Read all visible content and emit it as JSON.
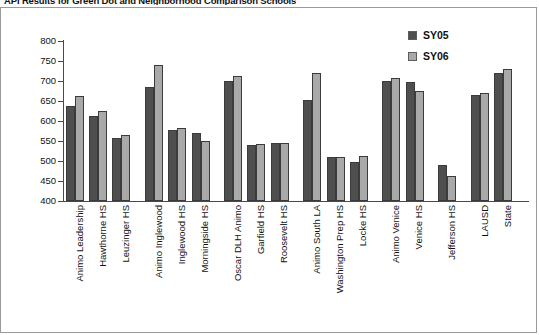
{
  "chart_title": "API Results for Green Dot and Neighborhood Comparison Schools",
  "legend": {
    "position": "top-right",
    "entries": [
      {
        "label": "SY05",
        "color": "#4f4f4f"
      },
      {
        "label": "SY06",
        "color": "#a9a9a9"
      }
    ]
  },
  "axis": {
    "y_ticks": [
      800,
      750,
      700,
      650,
      600,
      550,
      500,
      450,
      400
    ],
    "y_min": 400,
    "y_max": 800
  },
  "chart_data": {
    "type": "bar",
    "title": "API Results for Green Dot and Neighborhood Comparison Schools",
    "xlabel": "",
    "ylabel": "",
    "ylim": [
      400,
      800
    ],
    "grid": false,
    "legend_position": "top-right",
    "categories": [
      "Animo Leadership",
      "Hawthorne HS",
      "Leuzinger HS",
      "Animo Inglewood",
      "Inglewood HS",
      "Morningside HS",
      "Oscar DLH Animo",
      "Garfield HS",
      "Roosevelt HS",
      "Animo South LA",
      "Washington Prep HS",
      "Locke HS",
      "Animo Venice",
      "Venice HS",
      "Jefferson HS",
      "LAUSD",
      "State"
    ],
    "group_breaks_after": [
      2,
      5,
      8,
      11,
      13,
      14
    ],
    "series": [
      {
        "name": "SY05",
        "color": "#4f4f4f",
        "values": [
          638,
          613,
          557,
          685,
          578,
          570,
          699,
          541,
          544,
          652,
          510,
          497,
          700,
          698,
          490,
          665,
          721
        ]
      },
      {
        "name": "SY06",
        "color": "#a9a9a9",
        "values": [
          663,
          625,
          564,
          740,
          582,
          551,
          712,
          543,
          546,
          719,
          509,
          512,
          707,
          674,
          462,
          671,
          730
        ]
      }
    ]
  }
}
